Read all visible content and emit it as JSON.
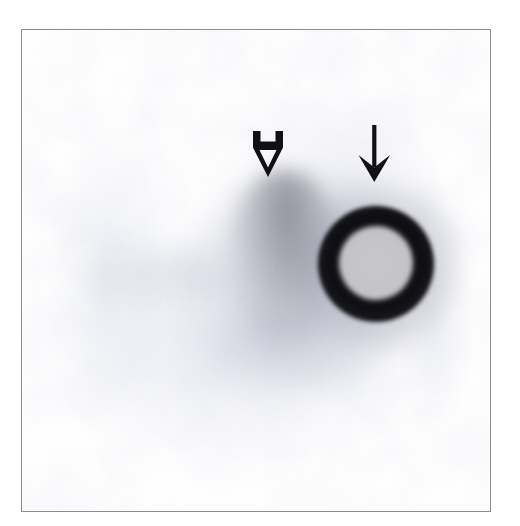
{
  "figure": {
    "domain": "Paper",
    "kind": "micrograph-plate",
    "caption_text": "",
    "frame": {
      "x": 21,
      "y": 29,
      "width": 470,
      "height": 483,
      "border_color": "#8d8d90",
      "background_color": "#ffffff"
    },
    "canvas": {
      "width": 520,
      "height": 526,
      "background_color": "#ffffff"
    }
  },
  "annotations": [
    {
      "id": "arrow-open-hollow",
      "name": "open-arrow-icon",
      "style": "hollow-outline-down-arrow",
      "direction": "down",
      "color": "#111115",
      "points_at": "faint-diffuse-smear",
      "x": 246,
      "y": 130,
      "width": 42,
      "height": 50
    },
    {
      "id": "arrow-solid",
      "name": "solid-arrow-icon",
      "style": "solid-line-down-arrow",
      "direction": "down",
      "color": "#111115",
      "points_at": "dark-ring-spot",
      "x": 354,
      "y": 124,
      "width": 40,
      "height": 60
    }
  ],
  "features": [
    {
      "id": "smear-band-main",
      "name": "faint-diffuse-smear",
      "description": "faint grey diffuse band",
      "color": "#6a6c78",
      "x": 205,
      "y": 140,
      "width": 115,
      "height": 175
    },
    {
      "id": "ring-spot",
      "name": "dark-ring-spot",
      "description": "dense dark oval ring with lighter centre",
      "rim_color": "#0d0d12",
      "core_color": "#c6c6ca",
      "x": 296,
      "y": 176,
      "width": 116,
      "height": 116
    }
  ],
  "palette": {
    "background": "#ffffff",
    "frame_border": "#8d8d90",
    "ink_black": "#111115",
    "ring_rim": "#0d0d12",
    "ring_core": "#c6c6ca",
    "smear_grey": "#6a6c78",
    "film_mottle": "#96a0be"
  }
}
